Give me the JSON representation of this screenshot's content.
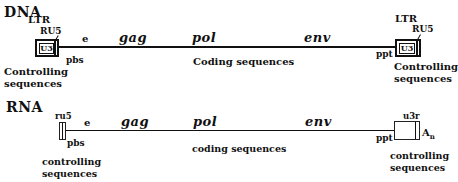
{
  "dna": {
    "label": "DNA",
    "left_ltr": {
      "ltr_label": "LTR",
      "ru5_label": "RU5",
      "u3_label": "U3",
      "pbs_label": "pbs",
      "caption_line1": "Controlling",
      "caption_line2": "sequences"
    },
    "right_ltr": {
      "ltr_label": "LTR",
      "ru5_label": "RU5",
      "u3_label": "U3",
      "ppt_label": "ppt",
      "caption_line1": "Controlling",
      "caption_line2": "sequences"
    },
    "e_label": "e",
    "genes": [
      "gag",
      "pol",
      "env"
    ],
    "coding_caption": "Coding sequences"
  },
  "rna": {
    "label": "RNA",
    "left": {
      "ru5_label": "ru5",
      "pbs_label": "pbs",
      "caption_line1": "controlling",
      "caption_line2": "sequences"
    },
    "right": {
      "u3r_label": "u3r",
      "ppt_label": "ppt",
      "polya_label": "A",
      "polya_sub": "n",
      "caption_line1": "controlling",
      "caption_line2": "sequences"
    },
    "e_label": "e",
    "genes": [
      "gag",
      "pol",
      "env"
    ],
    "coding_caption": "coding sequences"
  }
}
